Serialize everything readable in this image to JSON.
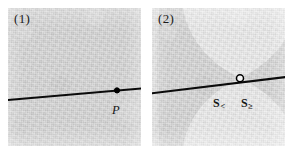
{
  "figure": {
    "width": 292,
    "height": 157,
    "background_color": "#ffffff",
    "panel_count": 2
  },
  "panels": [
    {
      "tag": "(1)",
      "name": "smooth-light-cone-panel",
      "background_color": "#d2d2d2",
      "texture": "uniform-gray-speckle",
      "line": {
        "name": "geodesic-line",
        "color": "#000000",
        "x1": -4,
        "y1": 92,
        "x2": 137,
        "y2": 80
      },
      "markers": [
        {
          "name": "point-P",
          "style": "filled-dot",
          "fill": "#000000",
          "stroke": "#000000",
          "x": 109,
          "y": 82,
          "r": 2.4
        }
      ],
      "labels": [
        {
          "name": "point-label-P",
          "text": "P",
          "style": "italic"
        }
      ]
    },
    {
      "tag": "(2)",
      "name": "singular-double-cone-panel",
      "background_color": "#d2d2d2",
      "texture": "gray-speckle-with-light-bowtie",
      "cone_region": {
        "name": "light-bowtie-region",
        "fill": "#eaeaea",
        "description": "two opposing cone lobes meeting at the central apex",
        "apex_x": 88,
        "apex_y": 70
      },
      "line": {
        "name": "geodesic-line",
        "color": "#000000",
        "x1": -4,
        "y1": 85,
        "x2": 137,
        "y2": 69
      },
      "markers": [
        {
          "name": "singular-point",
          "style": "open-circle",
          "fill": "#ffffff",
          "stroke": "#000000",
          "x": 88,
          "y": 70,
          "r": 3.4
        }
      ],
      "labels": [
        {
          "name": "sheet-label-less",
          "base": "S",
          "subscript": "<"
        },
        {
          "name": "sheet-label-greater",
          "base": "S",
          "subscript": "≥"
        }
      ]
    }
  ],
  "text": {
    "panel_1_tag": "(1)",
    "panel_2_tag": "(2)",
    "point_label": "P",
    "sheet_less_base": "S",
    "sheet_less_sub": "<",
    "sheet_greater_base": "S",
    "sheet_greater_sub": "≥"
  },
  "colors": {
    "panel_gray": "#d2d2d2",
    "cone_light": "#eaeaea",
    "ink": "#000000",
    "paper": "#ffffff"
  }
}
